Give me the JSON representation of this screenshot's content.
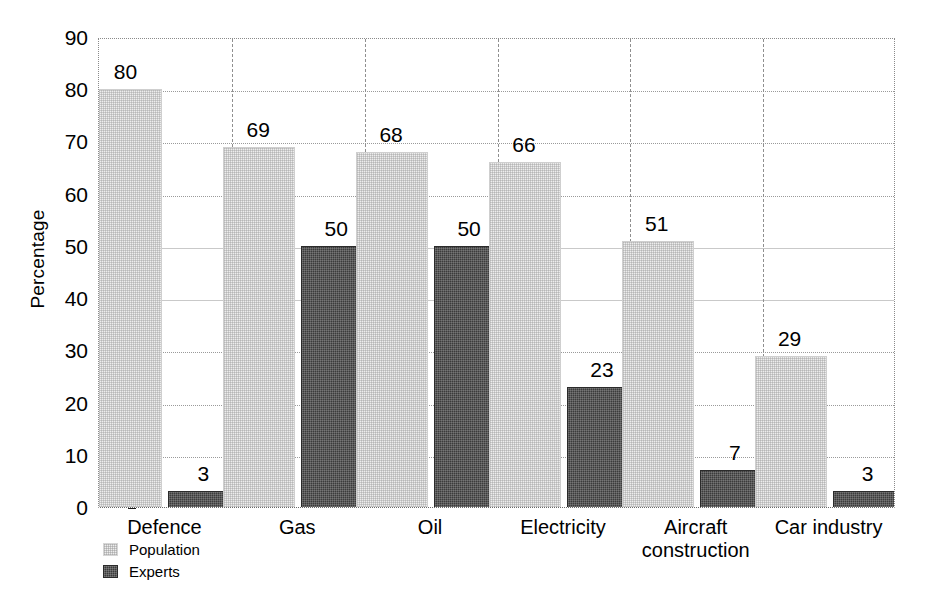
{
  "chart_data": {
    "type": "bar",
    "title": "",
    "xlabel": "",
    "ylabel": "Percentage",
    "ylim": [
      0,
      90
    ],
    "ytick_step": 10,
    "yticks": [
      0,
      10,
      20,
      30,
      40,
      50,
      60,
      70,
      80,
      90
    ],
    "ytick_labels": [
      "0",
      "10",
      "20",
      "30",
      "40",
      "50",
      "60",
      "70",
      "80",
      "90"
    ],
    "grid": true,
    "grid_axis": "y",
    "legend_position": "bottom-left",
    "categories": [
      "Defence",
      "Gas",
      "Oil",
      "Electricity",
      "Aircraft\nconstruction",
      "Car industry"
    ],
    "series": [
      {
        "name": "Population",
        "color": "#ededed",
        "values": [
          80,
          69,
          68,
          66,
          51,
          29
        ],
        "value_labels": [
          "80",
          "69",
          "68",
          "66",
          "51",
          "29"
        ]
      },
      {
        "name": "Experts",
        "color": "#3b3b3b",
        "values": [
          3,
          50,
          50,
          23,
          7,
          3
        ],
        "value_labels": [
          "3",
          "50",
          "50",
          "23",
          "7",
          "3"
        ]
      }
    ]
  },
  "axis": {
    "y_title": "Percentage"
  },
  "legend": {
    "entries": [
      {
        "label": "Population",
        "swatch": "population"
      },
      {
        "label": "Experts",
        "swatch": "experts"
      }
    ]
  }
}
